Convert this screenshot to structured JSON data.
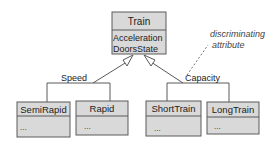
{
  "diagram": {
    "type": "UML class generalization",
    "superclass": {
      "name": "Train",
      "attributes": [
        "Acceleration",
        "DoorsState"
      ]
    },
    "generalizations": [
      {
        "discriminator": "Speed",
        "subclasses": [
          {
            "name": "SemiRapid",
            "body": "..."
          },
          {
            "name": "Rapid",
            "body": "..."
          }
        ]
      },
      {
        "discriminator": "Capacity",
        "subclasses": [
          {
            "name": "ShortTrain",
            "body": "..."
          },
          {
            "name": "LongTrain",
            "body": "..."
          }
        ]
      }
    ],
    "annotation": {
      "line1": "discriminating",
      "line2": "attribute"
    }
  },
  "colors": {
    "box_fill": "#d9d9d9",
    "stroke": "#5a5a5a",
    "text": "#222222"
  }
}
